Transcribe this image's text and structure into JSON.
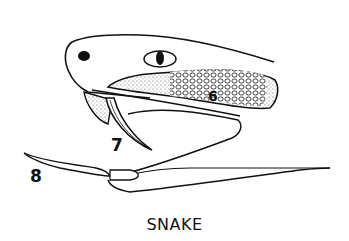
{
  "diagram": {
    "caption": "SNAKE",
    "labels": [
      {
        "id": "6",
        "text": "6",
        "points_to": "venom gland (stippled region)"
      },
      {
        "id": "7",
        "text": "7",
        "points_to": "fang"
      },
      {
        "id": "8",
        "text": "8",
        "points_to": "forked tongue"
      }
    ],
    "colors": {
      "ink": "#111111",
      "background": "#ffffff"
    }
  }
}
